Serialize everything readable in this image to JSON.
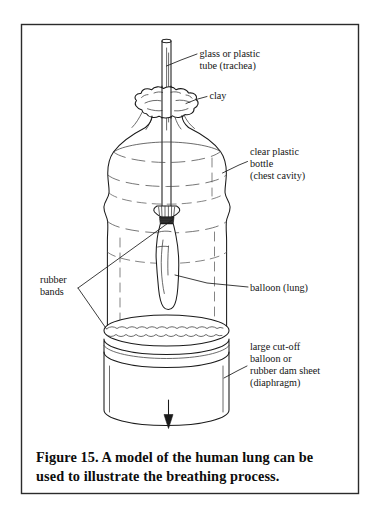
{
  "figure": {
    "frame": {
      "border_color": "#2b2b2b",
      "background": "#ffffff"
    },
    "caption": {
      "line1": "Figure 15.  A model of the human lung can be",
      "line2": "used to illustrate the breathing process.",
      "full": "Figure 15. A model of the human lung can be used to illustrate the breathing process."
    },
    "labels": [
      {
        "id": "tube",
        "name": "glass-or-plastic-tube",
        "lines": [
          "glass or plastic",
          "tube (trachea)"
        ],
        "side": "right"
      },
      {
        "id": "clay",
        "name": "clay",
        "lines": [
          "clay"
        ],
        "side": "right"
      },
      {
        "id": "bottle",
        "name": "clear-plastic-bottle",
        "lines": [
          "clear plastic",
          "bottle",
          "(chest cavity)"
        ],
        "side": "right"
      },
      {
        "id": "rubber-bands",
        "name": "rubber-bands",
        "lines": [
          "rubber",
          "bands"
        ],
        "side": "left"
      },
      {
        "id": "balloon",
        "name": "balloon-lung",
        "lines": [
          "balloon (lung)"
        ],
        "side": "right"
      },
      {
        "id": "diaphragm",
        "name": "diaphragm-sheet",
        "lines": [
          "large cut-off",
          "balloon or",
          "rubber dam sheet",
          "(diaphragm)"
        ],
        "side": "right"
      }
    ],
    "parts": [
      {
        "name": "tube",
        "semantic": "glass or plastic tube (trachea)"
      },
      {
        "name": "clay",
        "semantic": "clay seal around tube at bottle mouth"
      },
      {
        "name": "bottle",
        "semantic": "clear plastic bottle (chest cavity)"
      },
      {
        "name": "balloon",
        "semantic": "balloon (lung) tied to bottom of tube"
      },
      {
        "name": "rubber-band-upper",
        "semantic": "rubber band securing balloon to tube"
      },
      {
        "name": "rubber-band-lower",
        "semantic": "rubber band securing diaphragm sheet"
      },
      {
        "name": "diaphragm",
        "semantic": "large cut-off balloon or rubber dam sheet"
      },
      {
        "name": "arrow",
        "semantic": "downward pull arrow on diaphragm"
      }
    ],
    "arrow": {
      "direction": "down",
      "semantic": "pull diaphragm downward"
    }
  }
}
